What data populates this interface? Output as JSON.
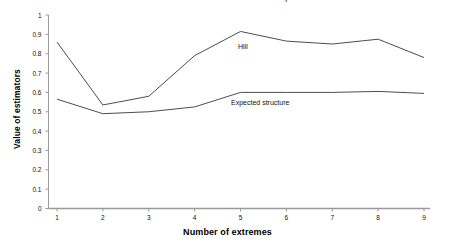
{
  "chart_data": {
    "type": "line",
    "title": "",
    "xlabel": "Number of extremes",
    "ylabel": "Value of estimators",
    "categories": [
      "1",
      "2",
      "3",
      "4",
      "5",
      "6",
      "7",
      "8",
      "9"
    ],
    "x": [
      1,
      2,
      3,
      4,
      5,
      6,
      7,
      8,
      9
    ],
    "xlim": [
      1,
      9
    ],
    "ylim": [
      0,
      1
    ],
    "ytick_labels": [
      "0",
      "0.1",
      "0.2",
      "0.3",
      "0.4",
      "0.5",
      "0.6",
      "0.7",
      "0.8",
      "0.9",
      "1"
    ],
    "ytick_values": [
      0,
      0.1,
      0.2,
      0.3,
      0.4,
      0.5,
      0.6,
      0.7,
      0.8,
      0.9,
      1
    ],
    "grid": false,
    "legend_position": "inline-annotations",
    "series": [
      {
        "name": "Hill",
        "values": [
          0.86,
          0.535,
          0.58,
          0.79,
          0.915,
          0.865,
          0.85,
          0.875,
          0.78
        ],
        "color": "#4d4d4d",
        "annotation": "Hill"
      },
      {
        "name": "Expected structure",
        "values": [
          0.565,
          0.49,
          0.5,
          0.525,
          0.6,
          0.6,
          0.6,
          0.605,
          0.595
        ],
        "color": "#4d4d4d",
        "annotation": "Expected structure"
      }
    ]
  },
  "chart": {
    "title_cropped": "Hill and expected structure",
    "y_axis_title": "Value of estimators",
    "x_axis_title": "Number of extremes",
    "hill_label": "Hill",
    "expected_label": "Expected structure",
    "axis_color": "#9a9a9a",
    "line_color": "#4d4d4d",
    "text_color": "#111111",
    "background": "#ffffff"
  }
}
